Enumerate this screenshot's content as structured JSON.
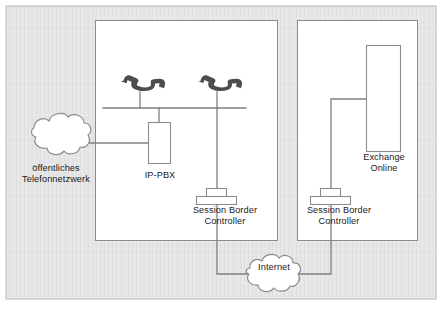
{
  "diagram": {
    "type": "network-topology",
    "language": "de",
    "background_color": "#e4e4e4",
    "panel_color": "#ffffff",
    "line_color": "#808080",
    "text_color": "#1b1b1b",
    "phone_icon_color": "#4d4d4d",
    "outer_border_color": "#b4b4b4"
  },
  "labels": {
    "pstn": "öffentliches\nTelefonnetzwerk",
    "ip_pbx": "IP-PBX",
    "sbc_left": "Session Border\nController",
    "sbc_right": "Session Border\nController",
    "exchange": "Exchange\nOnline",
    "internet": "Internet"
  },
  "nodes": [
    {
      "id": "pstn",
      "kind": "cloud",
      "label": "öffentliches Telefonnetzwerk",
      "zone": "outside"
    },
    {
      "id": "phone-1",
      "kind": "phone",
      "label": "",
      "zone": "on-premises"
    },
    {
      "id": "phone-2",
      "kind": "phone",
      "label": "",
      "zone": "on-premises"
    },
    {
      "id": "ip-pbx",
      "kind": "box",
      "label": "IP-PBX",
      "zone": "on-premises"
    },
    {
      "id": "sbc-left",
      "kind": "server",
      "label": "Session Border Controller",
      "zone": "on-premises"
    },
    {
      "id": "sbc-right",
      "kind": "server",
      "label": "Session Border Controller",
      "zone": "cloud"
    },
    {
      "id": "exchange",
      "kind": "box",
      "label": "Exchange Online",
      "zone": "cloud"
    },
    {
      "id": "internet",
      "kind": "cloud",
      "label": "Internet",
      "zone": "outside"
    }
  ],
  "zones": [
    {
      "id": "on-premises",
      "label": ""
    },
    {
      "id": "cloud",
      "label": ""
    }
  ],
  "connections": [
    {
      "from": "pstn",
      "to": "ip-pbx"
    },
    {
      "from": "phone-1",
      "to": "bus"
    },
    {
      "from": "phone-2",
      "to": "bus"
    },
    {
      "from": "ip-pbx",
      "to": "bus"
    },
    {
      "from": "bus",
      "to": "sbc-left"
    },
    {
      "from": "sbc-left",
      "to": "internet"
    },
    {
      "from": "internet",
      "to": "sbc-right"
    },
    {
      "from": "sbc-right",
      "to": "exchange"
    }
  ]
}
